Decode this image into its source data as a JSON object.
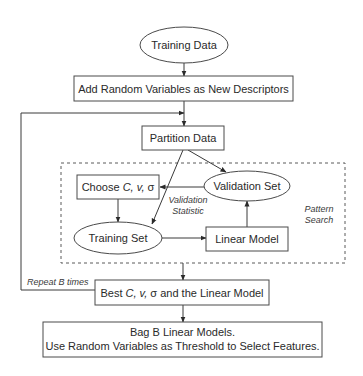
{
  "diagram": {
    "nodes": {
      "training_data": {
        "label": "Training Data",
        "shape": "ellipse"
      },
      "add_random": {
        "label": "Add Random Variables as New Descriptors",
        "shape": "rect"
      },
      "partition": {
        "label": "Partition Data",
        "shape": "rect"
      },
      "choose": {
        "label_prefix": "Choose ",
        "label_params": "C, v, ",
        "label_sigma": "σ",
        "shape": "rect"
      },
      "validation_set": {
        "label": "Validation Set",
        "shape": "ellipse"
      },
      "training_set": {
        "label": "Training Set",
        "shape": "ellipse"
      },
      "linear_model": {
        "label": "Linear Model",
        "shape": "rect"
      },
      "best": {
        "label_prefix": "Best ",
        "label_params": "C, v, ",
        "label_sigma": "σ",
        "label_suffix": " and the Linear Model",
        "shape": "rect"
      },
      "bag": {
        "line1": "Bag B Linear Models.",
        "line2": "Use Random Variables as Threshold to Select Features.",
        "shape": "rect"
      }
    },
    "annotations": {
      "validation_statistic_line1": "Validation",
      "validation_statistic_line2": "Statistic",
      "pattern_search_line1": "Pattern",
      "pattern_search_line2": "Search",
      "repeat": "Repeat B times"
    },
    "edges": [
      {
        "from": "Training Data",
        "to": "Add Random Variables as New Descriptors"
      },
      {
        "from": "Add Random Variables as New Descriptors",
        "to": "Partition Data"
      },
      {
        "from": "Partition Data",
        "to": "Training Set"
      },
      {
        "from": "Partition Data",
        "to": "Validation Set"
      },
      {
        "from": "Validation Set",
        "to": "Choose C, v, σ",
        "label": "Validation Statistic"
      },
      {
        "from": "Choose C, v, σ",
        "to": "Training Set"
      },
      {
        "from": "Training Set",
        "to": "Linear Model"
      },
      {
        "from": "Linear Model",
        "to": "Validation Set"
      },
      {
        "from": "Pattern Search",
        "to": "Best C, v, σ and the Linear Model"
      },
      {
        "from": "Best C, v, σ and the Linear Model",
        "to": "Partition Data",
        "label": "Repeat B times"
      },
      {
        "from": "Best C, v, σ and the Linear Model",
        "to": "Bag B Linear Models."
      }
    ],
    "groups": [
      {
        "name": "Pattern Search",
        "style": "dashed",
        "contains": [
          "Choose C, v, σ",
          "Validation Set",
          "Training Set",
          "Linear Model"
        ]
      }
    ]
  }
}
